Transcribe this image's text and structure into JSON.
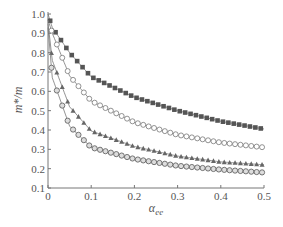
{
  "chart_data": {
    "type": "scatter",
    "title": "",
    "xlabel": "α_ee",
    "ylabel": "m*/m",
    "xlim": [
      0,
      0.5
    ],
    "ylim": [
      0.1,
      1.0
    ],
    "xticks": [
      "0",
      "0.1",
      "0.2",
      "0.3",
      "0.4",
      "0.5"
    ],
    "yticks": [
      "0.1",
      "0.2",
      "0.3",
      "0.4",
      "0.5",
      "0.6",
      "0.7",
      "0.8",
      "0.9",
      "1.0"
    ],
    "grid": false,
    "legend": "none",
    "series": [
      {
        "name": "filled squares",
        "marker": "square-filled",
        "x": [
          0.0,
          0.01,
          0.05,
          0.1,
          0.2,
          0.3,
          0.4,
          0.5
        ],
        "y": [
          1.0,
          0.93,
          0.8,
          0.675,
          0.57,
          0.5,
          0.445,
          0.405
        ]
      },
      {
        "name": "open circles",
        "marker": "circle-open",
        "x": [
          0.0,
          0.01,
          0.05,
          0.1,
          0.2,
          0.3,
          0.4,
          0.5
        ],
        "y": [
          0.97,
          0.9,
          0.68,
          0.55,
          0.44,
          0.375,
          0.335,
          0.31
        ]
      },
      {
        "name": "triangles",
        "marker": "triangle-filled",
        "x": [
          0.0,
          0.01,
          0.05,
          0.1,
          0.2,
          0.3,
          0.4,
          0.5
        ],
        "y": [
          0.95,
          0.76,
          0.52,
          0.395,
          0.315,
          0.265,
          0.235,
          0.22
        ]
      },
      {
        "name": "circled circles",
        "marker": "circle-double",
        "x": [
          0.0,
          0.01,
          0.05,
          0.1,
          0.2,
          0.3,
          0.4,
          0.5
        ],
        "y": [
          0.93,
          0.67,
          0.42,
          0.31,
          0.25,
          0.215,
          0.195,
          0.18
        ]
      }
    ]
  }
}
